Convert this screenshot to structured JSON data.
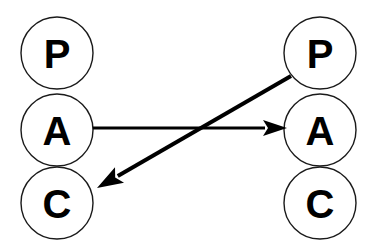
{
  "diagram": {
    "type": "node-link-diagram",
    "background_color": "#ffffff",
    "stroke_color": "#000000",
    "node_fill_color": "#ffffff",
    "node_stroke_color": "#1a1a1a",
    "label_color": "#000000",
    "columns": [
      {
        "id": "left",
        "name": "left-column",
        "center_x": 57,
        "nodes": [
          {
            "id": "left-p",
            "label": "P",
            "cx": 57,
            "cy": 53,
            "r": 36
          },
          {
            "id": "left-a",
            "label": "A",
            "cx": 57,
            "cy": 130,
            "r": 36
          },
          {
            "id": "left-c",
            "label": "C",
            "cx": 57,
            "cy": 203,
            "r": 36
          }
        ]
      },
      {
        "id": "right",
        "name": "right-column",
        "center_x": 320,
        "nodes": [
          {
            "id": "right-p",
            "label": "P",
            "cx": 320,
            "cy": 53,
            "r": 36
          },
          {
            "id": "right-a",
            "label": "A",
            "cx": 320,
            "cy": 130,
            "r": 36
          },
          {
            "id": "right-c",
            "label": "C",
            "cx": 320,
            "cy": 203,
            "r": 36
          }
        ]
      }
    ],
    "edges": [
      {
        "id": "edge-left-a-to-right-a",
        "name": "arrow-left-a-to-right-a",
        "from": "left-a",
        "to": "right-a",
        "x1": 93,
        "y1": 128,
        "x2": 287,
        "y2": 128,
        "stroke_width": 3,
        "arrowhead": "solid-triangle",
        "head_length": 24,
        "head_half_width": 8
      },
      {
        "id": "edge-right-p-to-left-c",
        "name": "arrow-right-p-to-left-c",
        "from": "right-p",
        "to": "left-c",
        "x1": 291,
        "y1": 76,
        "x2": 97,
        "y2": 188,
        "stroke_width": 4,
        "arrowhead": "solid-triangle",
        "head_length": 26,
        "head_half_width": 9
      }
    ]
  }
}
